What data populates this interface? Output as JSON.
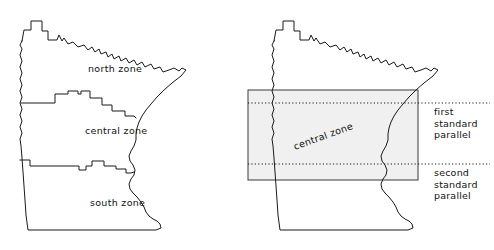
{
  "figure": {
    "background_color": "#ffffff",
    "outline_color": "#1a1a1a",
    "zone_fill_color": "#f0f0f0",
    "text_color": "#111111"
  },
  "left_map": {
    "name": "minnesota-zones-map",
    "caption": "",
    "zones": [
      {
        "id": "north",
        "label": "north zone",
        "x": 88,
        "y": 72
      },
      {
        "id": "central",
        "label": "central zone",
        "x": 85,
        "y": 134
      },
      {
        "id": "south",
        "label": "south zone",
        "x": 90,
        "y": 206
      }
    ]
  },
  "right_map": {
    "name": "central-zone-parallels-map",
    "caption": "",
    "zone_band": {
      "label": "central zone",
      "rotation_deg": -20,
      "x": 248,
      "y": 90,
      "width": 170,
      "height": 90,
      "fill": "#f0f0f0"
    },
    "parallels": [
      {
        "id": "first",
        "label": "first\nstandard\nparallel",
        "line_y": 103,
        "line_x_start": 248,
        "line_x_end": 490,
        "style": "dotted"
      },
      {
        "id": "second",
        "label": "second\nstandard\nparallel",
        "line_y": 164,
        "line_x_start": 248,
        "line_x_end": 490,
        "style": "dotted"
      }
    ]
  }
}
